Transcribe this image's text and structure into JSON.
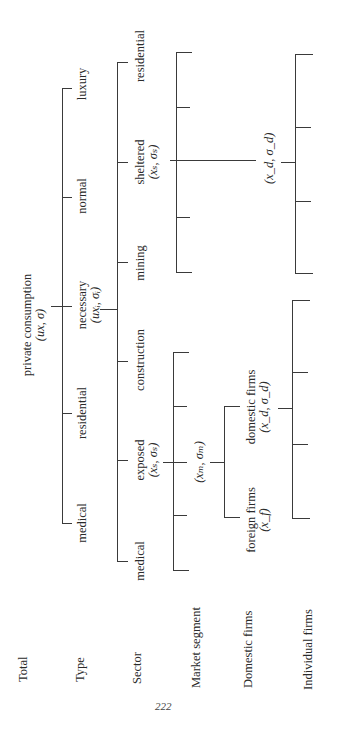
{
  "page_number": "222",
  "row_labels": [
    "Total",
    "Type",
    "Sector",
    "Market segment",
    "Domestic firms",
    "Individual firms"
  ],
  "total": {
    "label": "private consumption",
    "params": "(ux, σ)"
  },
  "types": [
    {
      "label": "luxury"
    },
    {
      "label": "normal"
    },
    {
      "label": "necessary",
      "params": "(uxᵢ, σᵢ)"
    },
    {
      "label": "residential"
    },
    {
      "label": "medical"
    }
  ],
  "sectors": [
    {
      "label": "residential"
    },
    {
      "label": "sheltered",
      "params": "(xₛ, σₛ)"
    },
    {
      "label": "mining"
    },
    {
      "label": "construction"
    },
    {
      "label": "exposed",
      "params": "(xₛ, σₛ)"
    },
    {
      "label": "medical"
    }
  ],
  "market_segment": {
    "label": "(xₘ, σₘ)"
  },
  "sheltered_domestic": {
    "label": "(x_d, σ_d)"
  },
  "domestic_firms": [
    {
      "label": "domestic firms",
      "params": "(x_d, σ_d)"
    },
    {
      "label": "foreign firms",
      "params": "(x_f)"
    }
  ]
}
